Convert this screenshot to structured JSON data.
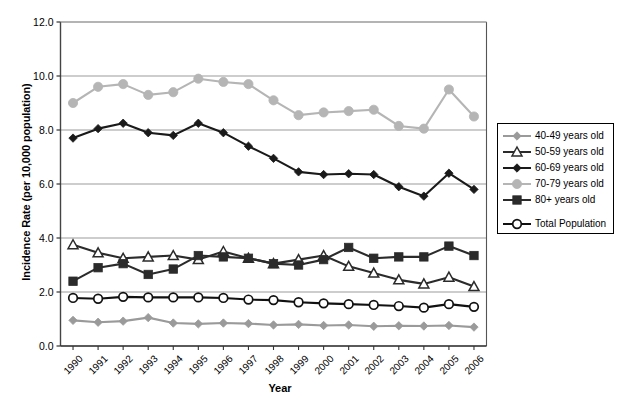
{
  "chart_data": {
    "type": "line",
    "title": "",
    "xlabel": "Year",
    "ylabel": "Incidence Rate (per 10,000 population)",
    "ylim": [
      0.0,
      12.0
    ],
    "yticks": [
      "0.0",
      "2.0",
      "4.0",
      "6.0",
      "8.0",
      "10.0",
      "12.0"
    ],
    "ytick_values": [
      0.0,
      2.0,
      4.0,
      6.0,
      8.0,
      10.0,
      12.0
    ],
    "grid": "horizontal",
    "legend_position": "right",
    "categories": [
      1990,
      1991,
      1992,
      1993,
      1994,
      1995,
      1996,
      1997,
      1998,
      1999,
      2000,
      2001,
      2002,
      2003,
      2004,
      2005,
      2006
    ],
    "xticks": [
      "1990",
      "1991",
      "1992",
      "1993",
      "1994",
      "1995",
      "1996",
      "1997",
      "1998",
      "1999",
      "2000",
      "2001",
      "2002",
      "2003",
      "2004",
      "2005",
      "2006"
    ],
    "series": [
      {
        "name": "40-49 years old",
        "color": "#9a9a9a",
        "marker": "diamond",
        "values": [
          0.95,
          0.88,
          0.92,
          1.05,
          0.85,
          0.82,
          0.85,
          0.83,
          0.78,
          0.8,
          0.76,
          0.78,
          0.73,
          0.75,
          0.74,
          0.76,
          0.7
        ]
      },
      {
        "name": "50-59 years old",
        "color": "#2b2b2b",
        "marker": "triangle-open",
        "values": [
          3.75,
          3.45,
          3.25,
          3.3,
          3.35,
          3.2,
          3.5,
          3.25,
          3.05,
          3.2,
          3.35,
          2.95,
          2.7,
          2.45,
          2.3,
          2.55,
          2.2
        ]
      },
      {
        "name": "60-69 years old",
        "color": "#1a1a1a",
        "marker": "diamond",
        "values": [
          7.7,
          8.05,
          8.25,
          7.9,
          7.8,
          8.25,
          7.9,
          7.4,
          6.95,
          6.45,
          6.35,
          6.38,
          6.35,
          5.9,
          5.55,
          6.4,
          5.8
        ]
      },
      {
        "name": "70-79 years old",
        "color": "#b5b5b5",
        "marker": "circle",
        "values": [
          9.0,
          9.6,
          9.7,
          9.3,
          9.4,
          9.9,
          9.78,
          9.7,
          9.1,
          8.55,
          8.65,
          8.7,
          8.75,
          8.15,
          8.05,
          9.5,
          8.5
        ]
      },
      {
        "name": "80+ years old",
        "color": "#2b2b2b",
        "marker": "square",
        "values": [
          2.4,
          2.9,
          3.05,
          2.65,
          2.85,
          3.35,
          3.3,
          3.25,
          3.05,
          3.0,
          3.2,
          3.65,
          3.25,
          3.3,
          3.3,
          3.7,
          3.35
        ]
      },
      {
        "name": "Total Population",
        "color": "#111111",
        "marker": "circle-open",
        "values": [
          1.78,
          1.75,
          1.82,
          1.8,
          1.8,
          1.8,
          1.78,
          1.72,
          1.7,
          1.62,
          1.58,
          1.55,
          1.52,
          1.48,
          1.42,
          1.55,
          1.45
        ]
      }
    ]
  },
  "legend": {
    "entries": [
      {
        "label": "40-49 years old"
      },
      {
        "label": "50-59 years old"
      },
      {
        "label": "60-69 years old"
      },
      {
        "label": "70-79 years old"
      },
      {
        "label": "80+ years old"
      },
      {
        "label": "Total Population"
      }
    ]
  },
  "axes": {
    "y_title": "Incidence Rate (per 10,000 population)",
    "x_title": "Year"
  }
}
